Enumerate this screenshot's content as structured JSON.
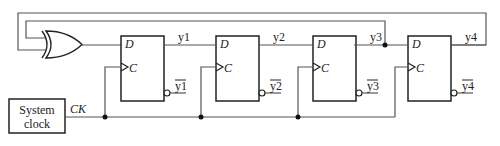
{
  "diagram": {
    "title": "",
    "clock": {
      "label_line1": "System",
      "label_line2": "clock",
      "signal": "CK"
    },
    "gate": {
      "type": "XOR"
    },
    "flipflops": [
      {
        "id": "ff1",
        "d": "D",
        "c": "C",
        "q": "y1",
        "qbar": "y1"
      },
      {
        "id": "ff2",
        "d": "D",
        "c": "C",
        "q": "y2",
        "qbar": "y2"
      },
      {
        "id": "ff3",
        "d": "D",
        "c": "C",
        "q": "y3",
        "qbar": "y3"
      },
      {
        "id": "ff4",
        "d": "D",
        "c": "C",
        "q": "y4",
        "qbar": "y4"
      }
    ],
    "feedback": [
      {
        "from": "y3",
        "to": "xor-input-1"
      },
      {
        "from": "y4",
        "to": "xor-input-2"
      }
    ],
    "colors": {
      "line": "#555555",
      "box": "#222222",
      "background": "#ffffff"
    }
  }
}
